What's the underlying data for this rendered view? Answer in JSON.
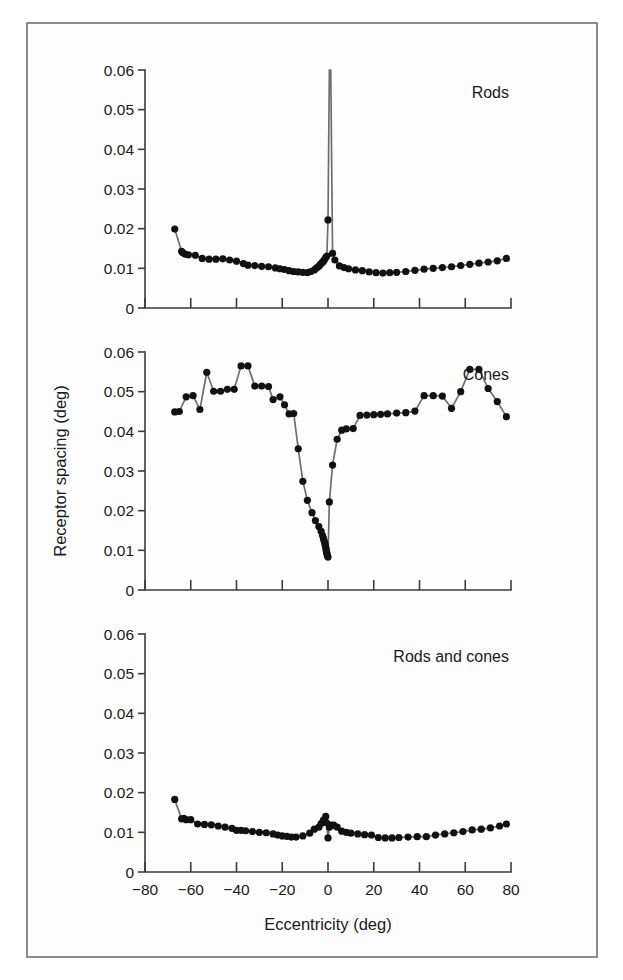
{
  "figure": {
    "background_color": "#fdfdfd",
    "frame_color": "#8a8a8a",
    "line_color": "#6f6f6f",
    "dot_color": "#111111",
    "axis_color": "#3b3b3b"
  },
  "axis": {
    "ylabel": "Receptor spacing (deg)",
    "xlabel": "Eccentricity (deg)",
    "ytick_labels": [
      "0.06",
      "0.05",
      "0.04",
      "0.03",
      "0.02",
      "0.01",
      "0"
    ],
    "ytick_values": [
      0.06,
      0.05,
      0.04,
      0.03,
      0.02,
      0.01,
      0
    ],
    "xtick_labels": [
      "−80",
      "−60",
      "−40",
      "−20",
      "0",
      "20",
      "40",
      "60",
      "80"
    ],
    "xtick_values": [
      -80,
      -60,
      -40,
      -20,
      0,
      20,
      40,
      60,
      80
    ],
    "xlim": [
      -80,
      80
    ],
    "ylim": [
      0,
      0.06
    ]
  },
  "chart_data": [
    {
      "type": "line",
      "panel_index": 0,
      "title": "Rods",
      "xlabel": "",
      "ylabel": "Receptor spacing (deg)",
      "xlim": [
        -80,
        80
      ],
      "ylim": [
        0,
        0.06
      ],
      "grid": false,
      "legend": "none",
      "annotation": "Spacing rises off-scale at the rod-free fovea (0 deg)",
      "x": [
        -67,
        -64,
        -63.5,
        -62.5,
        -61,
        -58,
        -55,
        -52,
        -49,
        -46,
        -43,
        -40,
        -37,
        -35,
        -32,
        -29,
        -26,
        -23,
        -21,
        -19,
        -17,
        -15,
        -13,
        -11,
        -9,
        -7.5,
        -6,
        -5,
        -4,
        -3.5,
        -3,
        -2.5,
        -2,
        -1.5,
        -1,
        -0.5,
        0,
        0.6,
        1.2,
        2,
        3,
        5,
        7,
        9,
        12,
        15,
        18,
        21,
        24,
        27,
        30,
        34,
        38,
        42,
        46,
        50,
        54,
        58,
        62,
        66,
        70,
        74,
        78
      ],
      "y": [
        0.0199,
        0.0143,
        0.0139,
        0.0136,
        0.0134,
        0.0133,
        0.0125,
        0.0123,
        0.0123,
        0.0124,
        0.0121,
        0.0118,
        0.0112,
        0.0108,
        0.0107,
        0.0105,
        0.0104,
        0.0101,
        0.0099,
        0.0097,
        0.0094,
        0.0092,
        0.0091,
        0.009,
        0.0089,
        0.0092,
        0.0096,
        0.0101,
        0.0105,
        0.0109,
        0.0112,
        0.0115,
        0.0118,
        0.0122,
        0.0127,
        0.0131,
        0.0222,
        0.06,
        0.06,
        0.0138,
        0.0121,
        0.0106,
        0.0102,
        0.0099,
        0.0096,
        0.0094,
        0.0091,
        0.0089,
        0.0088,
        0.0089,
        0.009,
        0.0092,
        0.0095,
        0.0098,
        0.01,
        0.0102,
        0.0104,
        0.0107,
        0.011,
        0.0113,
        0.0116,
        0.0119,
        0.0125
      ]
    },
    {
      "type": "line",
      "panel_index": 1,
      "title": "Cones",
      "xlabel": "",
      "ylabel": "Receptor spacing (deg)",
      "xlim": [
        -80,
        80
      ],
      "ylim": [
        0,
        0.06
      ],
      "grid": false,
      "legend": "none",
      "annotation": "Spacing dips to a minimum at the foveal centre (0 deg)",
      "x": [
        -67,
        -65,
        -62,
        -59,
        -56,
        -53,
        -50,
        -47,
        -44,
        -41,
        -38,
        -35,
        -32,
        -29,
        -26,
        -24,
        -21,
        -19,
        -17,
        -15,
        -13,
        -11,
        -9,
        -7,
        -5.5,
        -4,
        -3,
        -2.4,
        -2,
        -1.7,
        -1.4,
        -1.2,
        -1,
        -0.85,
        -0.7,
        -0.55,
        -0.4,
        -0.25,
        0,
        0.6,
        2,
        4,
        6,
        8,
        11,
        14,
        17,
        20,
        23,
        26,
        30,
        34,
        38,
        42,
        46,
        50,
        54,
        58,
        62,
        66,
        70,
        74,
        78
      ],
      "y": [
        0.0449,
        0.045,
        0.0487,
        0.049,
        0.0455,
        0.0549,
        0.0501,
        0.0501,
        0.0506,
        0.0506,
        0.0565,
        0.0565,
        0.0514,
        0.0514,
        0.0513,
        0.048,
        0.0487,
        0.0467,
        0.0444,
        0.0445,
        0.0356,
        0.0274,
        0.0226,
        0.0195,
        0.0175,
        0.016,
        0.0148,
        0.0138,
        0.013,
        0.0124,
        0.0118,
        0.0113,
        0.0108,
        0.0103,
        0.0098,
        0.0094,
        0.009,
        0.0086,
        0.0083,
        0.0222,
        0.0315,
        0.038,
        0.0403,
        0.0406,
        0.0407,
        0.044,
        0.0441,
        0.0442,
        0.0443,
        0.0444,
        0.0446,
        0.0447,
        0.0451,
        0.049,
        0.049,
        0.0489,
        0.0458,
        0.05,
        0.0556,
        0.0556,
        0.0508,
        0.0475,
        0.0437
      ]
    },
    {
      "type": "line",
      "panel_index": 2,
      "title": "Rods and cones",
      "xlabel": "Eccentricity (deg)",
      "ylabel": "Receptor spacing (deg)",
      "xlim": [
        -80,
        80
      ],
      "ylim": [
        0,
        0.06
      ],
      "grid": false,
      "legend": "none",
      "annotation": "Combined receptor spacing stays near 0.01 deg across the retina",
      "x": [
        -67,
        -64,
        -63,
        -62,
        -60,
        -57,
        -54,
        -51,
        -48,
        -45,
        -42,
        -40,
        -38,
        -36,
        -33,
        -30,
        -27,
        -24,
        -22,
        -20,
        -18,
        -16,
        -14,
        -11,
        -8,
        -6,
        -4,
        -3,
        -2,
        -1.4,
        -1,
        -0.6,
        0,
        0.6,
        1.4,
        2.5,
        4,
        6,
        8,
        10,
        13,
        16,
        19,
        22,
        25,
        28,
        31,
        35,
        39,
        43,
        47,
        51,
        55,
        59,
        63,
        67,
        71,
        75,
        78
      ],
      "y": [
        0.0183,
        0.0134,
        0.0135,
        0.0132,
        0.0132,
        0.0121,
        0.012,
        0.0119,
        0.0116,
        0.0113,
        0.011,
        0.0105,
        0.0105,
        0.0104,
        0.0102,
        0.01,
        0.0099,
        0.0096,
        0.0093,
        0.0091,
        0.009,
        0.0088,
        0.0088,
        0.0091,
        0.0098,
        0.0108,
        0.0113,
        0.0122,
        0.0131,
        0.0127,
        0.014,
        0.0124,
        0.0086,
        0.0113,
        0.0118,
        0.0118,
        0.0113,
        0.0103,
        0.01,
        0.0098,
        0.0096,
        0.0094,
        0.0093,
        0.0087,
        0.0086,
        0.0086,
        0.0087,
        0.0088,
        0.0089,
        0.0089,
        0.0093,
        0.0096,
        0.0099,
        0.0102,
        0.0106,
        0.0108,
        0.0111,
        0.0116,
        0.0121
      ]
    }
  ]
}
